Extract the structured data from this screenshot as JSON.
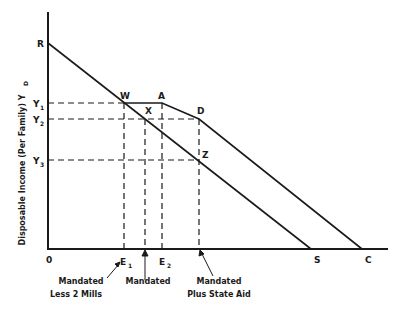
{
  "figure": {
    "type": "economic-diagram",
    "y_axis_label": "Disposable Income (Per Family) Y",
    "y_axis_label_subscript": "D",
    "origin_label": "0",
    "y_ticks": [
      {
        "label": "Y",
        "sub": "1",
        "y": 103
      },
      {
        "label": "Y",
        "sub": "2",
        "y": 119
      },
      {
        "label": "Y",
        "sub": "3",
        "y": 160
      }
    ],
    "x_ticks": [
      {
        "label": "E",
        "sub": "1",
        "x": 123
      },
      {
        "label": "E",
        "sub": "2",
        "x": 162
      }
    ],
    "points": {
      "R": "R",
      "W": "W",
      "A": "A",
      "X": "X",
      "D": "D",
      "Z": "Z",
      "S": "S",
      "C": "C"
    },
    "annotations": [
      {
        "line1": "Mandated",
        "line2": "Less 2 Mills"
      },
      {
        "line1": "Mandated",
        "line2": ""
      },
      {
        "line1": "Mandated",
        "line2": "Plus State Aid"
      }
    ],
    "colors": {
      "ink": "#1a1a1a",
      "background": "#ffffff"
    }
  }
}
